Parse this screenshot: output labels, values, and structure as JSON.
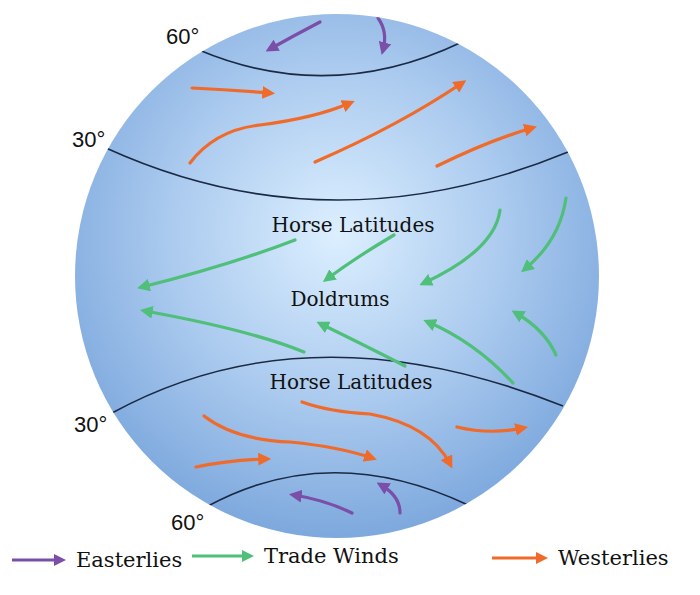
{
  "diagram": {
    "colors": {
      "globe_center": "#dcefff",
      "globe_edge": "#7fa9de",
      "latitude_line": "#1b2a44",
      "easterlies": "#7b4fa8",
      "trade_winds": "#4fbf7a",
      "westerlies": "#f06a2a"
    },
    "latitude_labels": {
      "north_60": "60°",
      "north_30": "30°",
      "south_30": "30°",
      "south_60": "60°"
    },
    "zone_labels": {
      "horse_latitudes_north": "Horse Latitudes",
      "doldrums": "Doldrums",
      "horse_latitudes_south": "Horse Latitudes"
    }
  },
  "legend": {
    "items": [
      {
        "label": "Easterlies",
        "color": "#7b4fa8"
      },
      {
        "label": "Trade Winds",
        "color": "#4fbf7a"
      },
      {
        "label": "Westerlies",
        "color": "#f06a2a"
      }
    ]
  }
}
